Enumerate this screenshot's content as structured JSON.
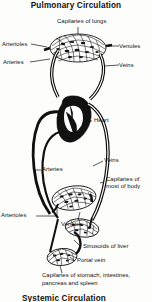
{
  "figure": {
    "title": "Pulmonary Circulation",
    "bottom_caption": "Systemic Circulation",
    "ink_color": "#101010",
    "paper_color": "#fdfdfb"
  },
  "labels": {
    "capillaries_of_lungs": "Capilaries of lungs",
    "arterioles_top": "Arterioles",
    "venules_top": "Venules",
    "arteries_top": "Arteries",
    "veins_top": "Veins",
    "heart": "Heart",
    "veins_mid": "Veins",
    "arteries_mid": "Arteries",
    "capillaries_of_body_line1": "Capilaries of",
    "capillaries_of_body_line2": "most of body",
    "arterioles_bottom": "Arterioles",
    "venules_bottom": "Venules",
    "sinusoids_of_liver": "Sinusoids of liver",
    "portal_vein": "Portal vein",
    "capillaries_gi_line1": "Capilaries of stomach, intestines,",
    "capillaries_gi_line2": "pancreas and spleen"
  },
  "icons": {
    "lung_capillary_bed": "hatched-lens-icon",
    "body_capillary_bed": "hatched-lens-icon",
    "liver_sinusoid_bed": "hatched-lens-icon",
    "gi_capillary_bed": "hatched-lens-icon",
    "heart": "heart-icon"
  }
}
